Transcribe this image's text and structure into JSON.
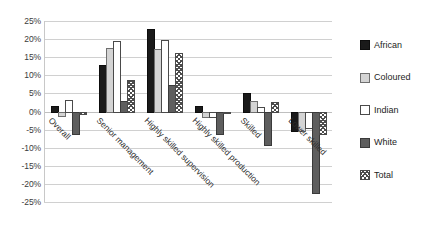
{
  "chart_data": {
    "type": "bar",
    "title": "",
    "xlabel": "",
    "ylabel": "",
    "ylim": [
      -25,
      25
    ],
    "ytick_labels": [
      "25%",
      "20%",
      "15%",
      "10%",
      "5%",
      "0%",
      "-5%",
      "-10%",
      "-15%",
      "-20%",
      "-25%"
    ],
    "ytick_values": [
      25,
      20,
      15,
      10,
      5,
      0,
      -5,
      -10,
      -15,
      -20,
      -25
    ],
    "grid": true,
    "legend_position": "right",
    "categories": [
      "Overall",
      "Senior management",
      "Highly skilled supervision",
      "Highly skilled production",
      "Skilled",
      "Lower skilled"
    ],
    "series": [
      {
        "name": "African",
        "color": "#1a1a1a",
        "pattern": "solid",
        "values": [
          1.4,
          12.8,
          22.8,
          1.5,
          5.0,
          -5.2
        ]
      },
      {
        "name": "Coloured",
        "color": "#d4d4d4",
        "pattern": "solid",
        "values": [
          -1.0,
          17.6,
          17.4,
          -1.2,
          3.0,
          -5.0
        ]
      },
      {
        "name": "Indian",
        "color": "#ffffff",
        "pattern": "outline",
        "values": [
          3.2,
          19.6,
          19.7,
          -1.2,
          1.2,
          -4.4
        ]
      },
      {
        "name": "White",
        "color": "#5e5e5e",
        "pattern": "solid",
        "values": [
          -6.0,
          2.9,
          7.3,
          -6.0,
          -9.0,
          -22.2
        ]
      },
      {
        "name": "Total",
        "color": "#4d4d4d",
        "pattern": "hatched",
        "values": [
          -0.3,
          8.8,
          16.1,
          -0.2,
          2.5,
          -6.0
        ]
      }
    ]
  },
  "legend": {
    "items": [
      {
        "label": "African"
      },
      {
        "label": "Coloured"
      },
      {
        "label": "Indian"
      },
      {
        "label": "White"
      },
      {
        "label": "Total"
      }
    ]
  }
}
